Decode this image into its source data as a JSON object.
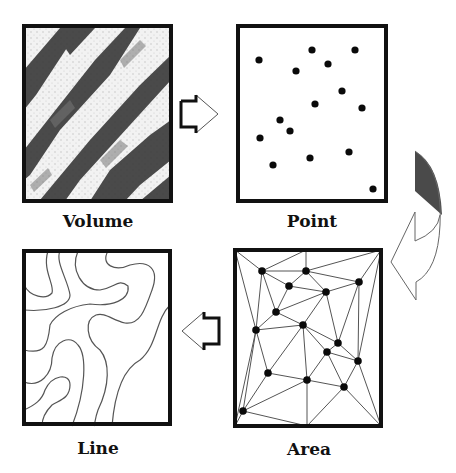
{
  "diagram": {
    "type": "cycle",
    "panels": [
      {
        "id": "volume",
        "label": "Volume",
        "frame": {
          "x": 22,
          "y": 24,
          "w": 151,
          "h": 179
        }
      },
      {
        "id": "point",
        "label": "Point",
        "frame": {
          "x": 236,
          "y": 24,
          "w": 152,
          "h": 179
        }
      },
      {
        "id": "area",
        "label": "Area",
        "frame": {
          "x": 233,
          "y": 248,
          "w": 150,
          "h": 180
        }
      },
      {
        "id": "line",
        "label": "Line",
        "frame": {
          "x": 22,
          "y": 249,
          "w": 150,
          "h": 177
        }
      }
    ],
    "flow": [
      "Volume",
      "Point",
      "Area",
      "Line"
    ],
    "arrows": [
      {
        "from": "Volume",
        "to": "Point",
        "direction": "right"
      },
      {
        "from": "Point",
        "to": "Area",
        "direction": "curved-down-left"
      },
      {
        "from": "Area",
        "to": "Line",
        "direction": "left"
      }
    ],
    "colors": {
      "frame": "#111111",
      "line": "#555555",
      "dot": "#0a0a0a",
      "shade": "#4a4a4a",
      "terrain_dark": "#3c3c3c",
      "terrain_light": "#eeeeee"
    }
  },
  "point_panel": {
    "dots": [
      [
        259,
        60
      ],
      [
        312,
        50
      ],
      [
        355,
        50
      ],
      [
        296,
        71
      ],
      [
        328,
        64
      ],
      [
        342,
        91
      ],
      [
        315,
        104
      ],
      [
        362,
        108
      ],
      [
        280,
        120
      ],
      [
        290,
        131
      ],
      [
        260,
        138
      ],
      [
        273,
        165
      ],
      [
        310,
        158
      ],
      [
        349,
        152
      ],
      [
        373,
        189
      ]
    ]
  },
  "area_panel": {
    "nodes": [
      [
        262,
        271
      ],
      [
        306,
        271
      ],
      [
        289,
        286
      ],
      [
        326,
        292
      ],
      [
        359,
        282
      ],
      [
        276,
        312
      ],
      [
        303,
        325
      ],
      [
        256,
        330
      ],
      [
        338,
        343
      ],
      [
        327,
        352
      ],
      [
        358,
        361
      ],
      [
        268,
        373
      ],
      [
        307,
        380
      ],
      [
        344,
        387
      ],
      [
        243,
        411
      ]
    ]
  }
}
